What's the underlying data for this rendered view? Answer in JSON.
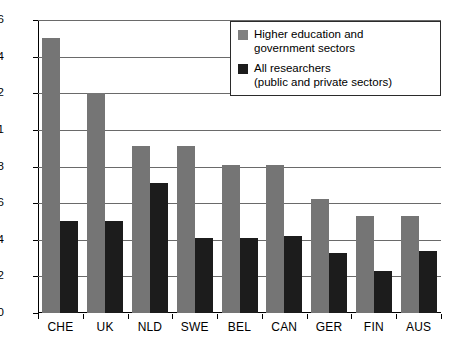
{
  "chart_data": {
    "type": "bar",
    "title": "",
    "subtitle": "",
    "xlabel": "",
    "ylabel": "",
    "categories": [
      "CHE",
      "UK",
      "NLD",
      "SWE",
      "BEL",
      "CAN",
      "GER",
      "FIN",
      "AUS"
    ],
    "series": [
      {
        "name": "Higher education and government sectors",
        "name_line1": "Higher education and",
        "name_line2": "government sectors",
        "color": "#757575",
        "values": [
          1.5,
          1.2,
          0.91,
          0.91,
          0.81,
          0.81,
          0.62,
          0.53,
          0.53
        ]
      },
      {
        "name": "All researchers (public and private sectors)",
        "name_line1": "All researchers",
        "name_line2": "(public and private sectors)",
        "color": "#1c1c1c",
        "values": [
          0.5,
          0.5,
          0.71,
          0.41,
          0.41,
          0.42,
          0.33,
          0.23,
          0.34
        ]
      }
    ],
    "ylim": [
      0,
      1.6
    ],
    "yticks": [
      0,
      0.2,
      0.4,
      0.6,
      0.8,
      1,
      1.2,
      1.4,
      1.6
    ],
    "ytick_labels": [
      "0",
      "0.2",
      "0.4",
      "0.6",
      "0.8",
      "1",
      "1.2",
      "1.4",
      "1.6"
    ],
    "grid": true,
    "legend_position": "top-right"
  }
}
